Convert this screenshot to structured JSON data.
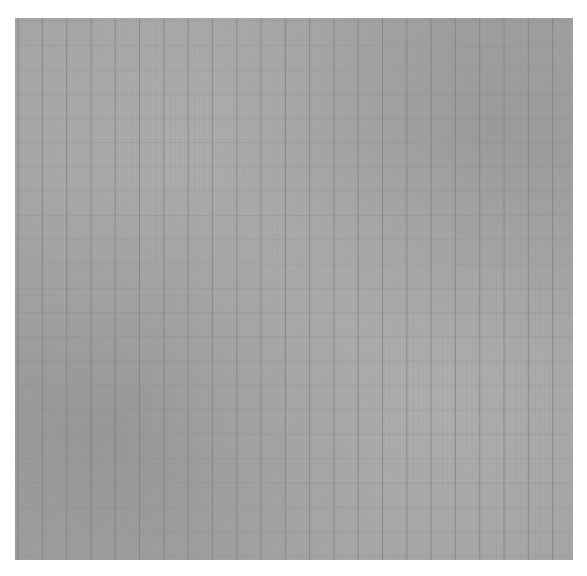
{
  "image": {
    "subject": "grid-paper",
    "background_color": "#ffffff",
    "paper_color": "#a3a3a3",
    "line_color": "#7e7e7e",
    "minor_line_color": "#969696",
    "major_spacing_px": 24.3,
    "minor_spacing_px": 4.86,
    "paper_box": {
      "x": 15,
      "y": 18,
      "width": 558,
      "height": 542
    }
  }
}
